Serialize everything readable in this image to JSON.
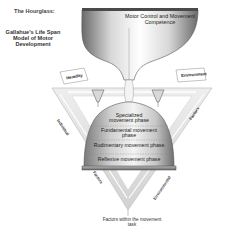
{
  "title": "The Hourglass:",
  "subtitle": "Gallahue's Life Span Model of Motor Development",
  "hourglass": {
    "top_label": "Motor Control and Movement Competence",
    "phases": [
      "Specialized movement phase",
      "Fundamental movement phase",
      "Rudimentary movement phase",
      "Reflexive movement phase"
    ]
  },
  "sand_sources": {
    "left": "Heredity",
    "right": "Environment"
  },
  "triangle": {
    "left_side": "Individual",
    "right_side": "Factors",
    "bottom_left": "Factors",
    "bottom_right": "Environmental",
    "bottom_label": "Factors within the movement task"
  },
  "colors": {
    "background": "#ffffff",
    "glass_dark": "#555555",
    "glass_light": "#f2f2f2",
    "triangle_fill": "#e6e6e6",
    "text": "#222222"
  }
}
